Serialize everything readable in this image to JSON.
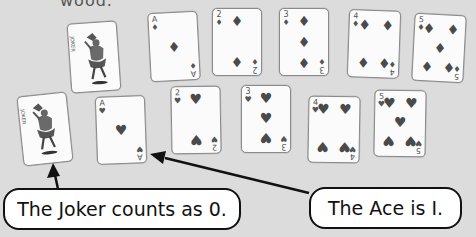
{
  "header": {
    "cut_text": "wood."
  },
  "cards": {
    "row_top": [
      {
        "rank": "Joker",
        "suit": "joker",
        "value": 0
      },
      {
        "rank": "A",
        "suit": "diamonds",
        "value": 1
      },
      {
        "rank": "2",
        "suit": "diamonds",
        "value": 2
      },
      {
        "rank": "3",
        "suit": "diamonds",
        "value": 3
      },
      {
        "rank": "4",
        "suit": "diamonds",
        "value": 4
      },
      {
        "rank": "5",
        "suit": "diamonds",
        "value": 5
      }
    ],
    "row_bottom": [
      {
        "rank": "Joker",
        "suit": "joker",
        "value": 0
      },
      {
        "rank": "A",
        "suit": "hearts",
        "value": 1
      },
      {
        "rank": "2",
        "suit": "hearts",
        "value": 2
      },
      {
        "rank": "3",
        "suit": "hearts",
        "value": 3
      },
      {
        "rank": "4",
        "suit": "hearts",
        "value": 4
      },
      {
        "rank": "5",
        "suit": "hearts",
        "value": 5
      }
    ],
    "suit_glyphs": {
      "diamonds": "♦",
      "hearts": "♥"
    },
    "joker_index": "JOKER"
  },
  "callouts": {
    "joker": "The Joker counts as 0.",
    "ace": "The Ace is I."
  },
  "colors": {
    "background": "#dcdcdc",
    "card": "#fbfbfb",
    "pip": "#4a4a4a",
    "outline": "#111111"
  }
}
